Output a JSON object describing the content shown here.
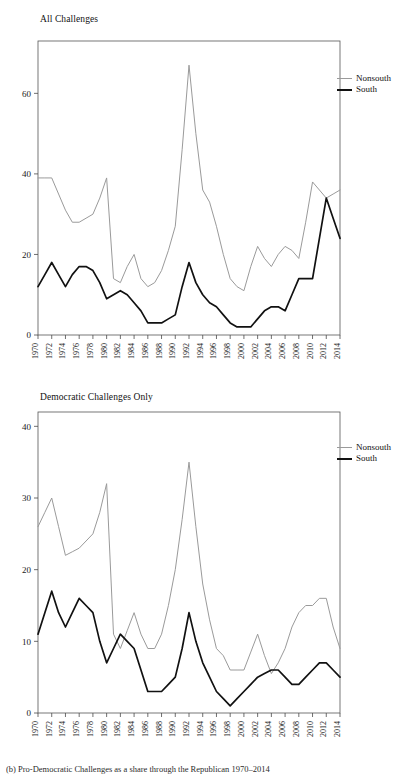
{
  "figure": {
    "caption": "(b) Pro-Democratic Challenges as a share through the Republican 1970–2014",
    "legend": {
      "nonsouth_label": "Nonsouth",
      "south_label": "South",
      "nonsouth_color": "#9a9a9a",
      "south_color": "#111111"
    }
  },
  "chart_data": [
    {
      "type": "line",
      "title": "All Challenges",
      "xlabel": "",
      "ylabel": "",
      "xlim": [
        1970,
        2014
      ],
      "ylim": [
        0,
        73
      ],
      "yticks": [
        0,
        20,
        40,
        60
      ],
      "ytick_labels": [
        "0",
        "20",
        "40",
        "60"
      ],
      "grid": false,
      "legend_position": "right",
      "x": [
        1970,
        1971,
        1972,
        1973,
        1974,
        1975,
        1976,
        1977,
        1978,
        1979,
        1980,
        1981,
        1982,
        1983,
        1984,
        1985,
        1986,
        1987,
        1988,
        1989,
        1990,
        1991,
        1992,
        1993,
        1994,
        1995,
        1996,
        1997,
        1998,
        1999,
        2000,
        2001,
        2002,
        2003,
        2004,
        2005,
        2006,
        2007,
        2008,
        2009,
        2010,
        2011,
        2012,
        2013,
        2014
      ],
      "xtick_labels": [
        "1970",
        "1972",
        "1974",
        "1976",
        "1978",
        "1980",
        "1982",
        "1984",
        "1986",
        "1988",
        "1990",
        "1992",
        "1994",
        "1996",
        "1998",
        "2000",
        "2002",
        "2004",
        "2006",
        "2008",
        "2010",
        "2012",
        "2014"
      ],
      "series": [
        {
          "name": "Nonsouth",
          "color": "#9a9a9a",
          "values": [
            39,
            39,
            39,
            35,
            31,
            28,
            28,
            29,
            30,
            34,
            39,
            14,
            13,
            17,
            20,
            14,
            12,
            13,
            16,
            21,
            27,
            46,
            67,
            50,
            36,
            33,
            27,
            20,
            14,
            12,
            11,
            17,
            22,
            19,
            17,
            20,
            22,
            21,
            19,
            28,
            38,
            36,
            34,
            35,
            36
          ]
        },
        {
          "name": "South",
          "color": "#111111",
          "values": [
            12,
            15,
            18,
            15,
            12,
            15,
            17,
            17,
            16,
            13,
            9,
            10,
            11,
            10,
            8,
            6,
            3,
            3,
            3,
            4,
            5,
            12,
            18,
            13,
            10,
            8,
            7,
            5,
            3,
            2,
            2,
            2,
            4,
            6,
            7,
            7,
            6,
            10,
            14,
            14,
            14,
            24,
            34,
            29,
            24
          ]
        }
      ]
    },
    {
      "type": "line",
      "title": "Democratic Challenges Only",
      "xlabel": "",
      "ylabel": "",
      "xlim": [
        1970,
        2014
      ],
      "ylim": [
        0,
        42
      ],
      "yticks": [
        0,
        10,
        20,
        30,
        40
      ],
      "ytick_labels": [
        "0",
        "10",
        "20",
        "30",
        "40"
      ],
      "grid": false,
      "legend_position": "right",
      "x": [
        1970,
        1971,
        1972,
        1973,
        1974,
        1975,
        1976,
        1977,
        1978,
        1979,
        1980,
        1981,
        1982,
        1983,
        1984,
        1985,
        1986,
        1987,
        1988,
        1989,
        1990,
        1991,
        1992,
        1993,
        1994,
        1995,
        1996,
        1997,
        1998,
        1999,
        2000,
        2001,
        2002,
        2003,
        2004,
        2005,
        2006,
        2007,
        2008,
        2009,
        2010,
        2011,
        2012,
        2013,
        2014
      ],
      "xtick_labels": [
        "1970",
        "1972",
        "1974",
        "1976",
        "1978",
        "1980",
        "1982",
        "1984",
        "1986",
        "1988",
        "1990",
        "1992",
        "1994",
        "1996",
        "1998",
        "2000",
        "2002",
        "2004",
        "2006",
        "2008",
        "2010",
        "2012",
        "2014"
      ],
      "series": [
        {
          "name": "Nonsouth",
          "color": "#9a9a9a",
          "values": [
            26,
            28,
            30,
            26,
            22,
            22.5,
            23,
            24,
            25,
            28,
            32,
            11,
            9,
            11.5,
            14,
            11,
            9,
            9,
            11,
            15,
            20,
            27,
            35,
            26,
            18,
            13,
            9,
            8,
            6,
            6,
            6,
            8.5,
            11,
            8,
            5.5,
            7,
            9,
            12,
            14,
            15,
            15,
            16,
            16,
            12,
            9
          ]
        },
        {
          "name": "South",
          "color": "#111111",
          "values": [
            11,
            14,
            17,
            14,
            12,
            14,
            16,
            15,
            14,
            10,
            7,
            9,
            11,
            10,
            9,
            6,
            3,
            3,
            3,
            4,
            5,
            9,
            14,
            10,
            7,
            5,
            3,
            2,
            1,
            2,
            3,
            4,
            5,
            5.5,
            6,
            6,
            5,
            4,
            4,
            5,
            6,
            7,
            7,
            6,
            5
          ]
        }
      ]
    }
  ]
}
